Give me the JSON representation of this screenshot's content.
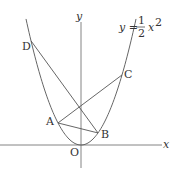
{
  "diagram": {
    "axes": {
      "x_label": "x",
      "y_label": "y",
      "origin_label": "O"
    },
    "curve": {
      "equation_lhs": "y =",
      "fraction_numerator": "1",
      "fraction_denominator": "2",
      "variable": "x",
      "exponent": "2",
      "a": 0.5
    },
    "points": [
      {
        "label": "A"
      },
      {
        "label": "B"
      },
      {
        "label": "C"
      },
      {
        "label": "D"
      }
    ],
    "segments": [
      [
        "A",
        "B"
      ],
      [
        "A",
        "C"
      ],
      [
        "D",
        "B"
      ]
    ]
  }
}
